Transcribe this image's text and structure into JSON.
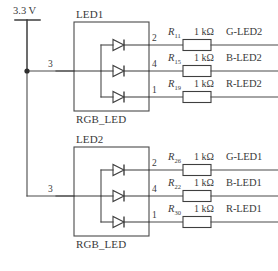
{
  "diagram": {
    "supply": {
      "label": "3.3 V",
      "symbol": "power-rail"
    },
    "common_resistance": "1 kΩ",
    "blocks": [
      {
        "ref": "LED1",
        "device": "RGB_LED",
        "common_pin": "3",
        "channels": [
          {
            "pin": "2",
            "resistor": "R",
            "sub": "11",
            "value": "1 kΩ",
            "net": "G-LED2"
          },
          {
            "pin": "4",
            "resistor": "R",
            "sub": "15",
            "value": "1 kΩ",
            "net": "B-LED2"
          },
          {
            "pin": "1",
            "resistor": "R",
            "sub": "19",
            "value": "1 kΩ",
            "net": "R-LED2"
          }
        ]
      },
      {
        "ref": "LED2",
        "device": "RGB_LED",
        "common_pin": "3",
        "channels": [
          {
            "pin": "2",
            "resistor": "R",
            "sub": "26",
            "value": "1 kΩ",
            "net": "G-LED1"
          },
          {
            "pin": "4",
            "resistor": "R",
            "sub": "22",
            "value": "1 kΩ",
            "net": "B-LED1"
          },
          {
            "pin": "1",
            "resistor": "R",
            "sub": "30",
            "value": "1 kΩ",
            "net": "R-LED1"
          }
        ]
      }
    ]
  },
  "colors": {
    "wire": "#4a4a4a",
    "text": "#3a3a3a",
    "background": "#ffffff"
  }
}
